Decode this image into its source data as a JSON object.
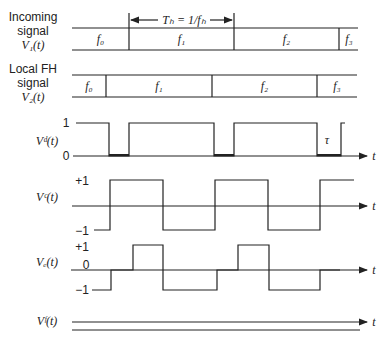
{
  "labels": {
    "incoming": {
      "line1": "Incoming",
      "line2": "signal",
      "line3": "V₁(t)"
    },
    "local": {
      "line1": "Local FH",
      "line2": "signal",
      "line3": "V₂(t)"
    },
    "vd": "Vᵈ(t)",
    "vc": "Vᶜ(t)",
    "ve": "Vₑ(t)",
    "vf": "Vᶠ(t)"
  },
  "hop_period": "Tₕ = 1/fₕ",
  "incoming_segments": [
    "f₀",
    "f₁",
    "f₂",
    "f₃"
  ],
  "local_segments": [
    "f₀",
    "f₁",
    "f₂",
    "f₃"
  ],
  "vd_levels": {
    "high": "1",
    "low": "0"
  },
  "vc_levels": {
    "high": "+1",
    "low": "−1"
  },
  "ve_levels": {
    "high": "+1",
    "zero": "0",
    "low": "−1"
  },
  "tau": "τ",
  "time_axis": "t",
  "colors": {
    "ink": "#222222",
    "background": "#ffffff"
  }
}
